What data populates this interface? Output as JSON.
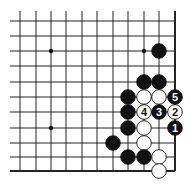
{
  "diagram": {
    "type": "go-board-corner",
    "grid": {
      "cols_x": [
        20,
        36,
        51,
        66,
        82,
        97,
        113,
        128,
        144,
        159,
        175
      ],
      "rows_y": [
        21,
        36,
        51,
        66,
        82,
        97,
        112,
        128,
        143,
        157,
        171
      ],
      "right_edge": true,
      "bottom_edge": true,
      "line_color": "#222222"
    },
    "star_points": [
      [
        2,
        2
      ],
      [
        8,
        2
      ],
      [
        2,
        7
      ]
    ],
    "stones": [
      {
        "col": 9,
        "row": 2,
        "color": "black",
        "label": ""
      },
      {
        "col": 8,
        "row": 4,
        "color": "black",
        "label": ""
      },
      {
        "col": 9,
        "row": 4,
        "color": "black",
        "label": ""
      },
      {
        "col": 7,
        "row": 5,
        "color": "black",
        "label": ""
      },
      {
        "col": 8,
        "row": 5,
        "color": "white",
        "label": ""
      },
      {
        "col": 9,
        "row": 5,
        "color": "white",
        "label": ""
      },
      {
        "col": 10,
        "row": 5,
        "color": "black",
        "label": "5"
      },
      {
        "col": 7,
        "row": 6,
        "color": "black",
        "label": ""
      },
      {
        "col": 8,
        "row": 6,
        "color": "white",
        "label": "4"
      },
      {
        "col": 9,
        "row": 6,
        "color": "black",
        "label": "3"
      },
      {
        "col": 10,
        "row": 6,
        "color": "white",
        "label": "2"
      },
      {
        "col": 7,
        "row": 7,
        "color": "black",
        "label": ""
      },
      {
        "col": 8,
        "row": 7,
        "color": "white",
        "label": ""
      },
      {
        "col": 10,
        "row": 7,
        "color": "black",
        "label": "1"
      },
      {
        "col": 6,
        "row": 8,
        "color": "black",
        "label": ""
      },
      {
        "col": 8,
        "row": 8,
        "color": "white",
        "label": ""
      },
      {
        "col": 7,
        "row": 9,
        "color": "black",
        "label": ""
      },
      {
        "col": 8,
        "row": 9,
        "color": "black",
        "label": ""
      },
      {
        "col": 9,
        "row": 9,
        "color": "white",
        "label": ""
      },
      {
        "col": 9,
        "row": 10,
        "color": "white",
        "label": ""
      }
    ]
  }
}
